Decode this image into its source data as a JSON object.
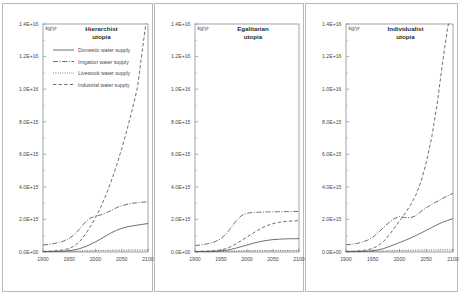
{
  "figure": {
    "unit_label": "kg/yr",
    "xlabel": "",
    "ylabel": "",
    "y_ticks": [
      "0.0E+00",
      "2.0E+15",
      "4.0E+15",
      "6.0E+15",
      "8.0E+15",
      "1.0E+16",
      "1.2E+16",
      "1.4E+16"
    ],
    "x_ticks": [
      "1900",
      "1950",
      "2000",
      "2050",
      "2100"
    ],
    "legend": [
      {
        "label": "Domestic water supply",
        "style": "solid",
        "key": "domestic"
      },
      {
        "label": "Irrigation water supply",
        "style": "dash-dot",
        "key": "irrigation"
      },
      {
        "label": "Livestock water supply",
        "style": "dotted",
        "key": "livestock"
      },
      {
        "label": "Industrial water supply",
        "style": "dashed",
        "key": "industrial"
      }
    ],
    "panels": [
      {
        "title_line1": "Hierarchist",
        "title_line2": "utopia"
      },
      {
        "title_line1": "Egalitarian",
        "title_line2": "utopia"
      },
      {
        "title_line1": "Individualist",
        "title_line2": "utopia"
      }
    ]
  },
  "chart_data": [
    {
      "type": "line",
      "title": "Hierarchist utopia",
      "xlabel": "",
      "ylabel": "kg/yr",
      "xlim": [
        1900,
        2100
      ],
      "ylim": [
        0,
        1.4e+16
      ],
      "grid": false,
      "legend_position": "top-left",
      "x": [
        1900,
        1910,
        1920,
        1930,
        1940,
        1950,
        1960,
        1970,
        1980,
        1990,
        2000,
        2010,
        2020,
        2030,
        2040,
        2050,
        2060,
        2070,
        2080,
        2090,
        2100
      ],
      "series": [
        {
          "name": "Domestic water supply",
          "style": "solid",
          "values": [
            20000000000000.0,
            25000000000000.0,
            30000000000000.0,
            40000000000000.0,
            55000000000000.0,
            80000000000000.0,
            130000000000000.0,
            210000000000000.0,
            320000000000000.0,
            460000000000000.0,
            620000000000000.0,
            800000000000000.0,
            1000000000000000.0,
            1180000000000000.0,
            1330000000000000.0,
            1450000000000000.0,
            1540000000000000.0,
            1600000000000000.0,
            1650000000000000.0,
            1700000000000000.0,
            1750000000000000.0
          ]
        },
        {
          "name": "Irrigation water supply",
          "style": "dash-dot",
          "values": [
            430000000000000.0,
            460000000000000.0,
            510000000000000.0,
            580000000000000.0,
            680000000000000.0,
            830000000000000.0,
            1080000000000000.0,
            1420000000000000.0,
            1820000000000000.0,
            2080000000000000.0,
            2200000000000000.0,
            2280000000000000.0,
            2400000000000000.0,
            2560000000000000.0,
            2720000000000000.0,
            2840000000000000.0,
            2930000000000000.0,
            2990000000000000.0,
            3030000000000000.0,
            3060000000000000.0,
            3080000000000000.0
          ]
        },
        {
          "name": "Livestock water supply",
          "style": "dotted",
          "values": [
            20000000000000.0,
            22000000000000.0,
            25000000000000.0,
            28000000000000.0,
            32000000000000.0,
            38000000000000.0,
            45000000000000.0,
            54000000000000.0,
            64000000000000.0,
            74000000000000.0,
            84000000000000.0,
            92000000000000.0,
            100000000000000.0,
            107000000000000.0,
            112000000000000.0,
            117000000000000.0,
            120000000000000.0,
            123000000000000.0,
            125000000000000.0,
            127000000000000.0,
            128000000000000.0
          ]
        },
        {
          "name": "Industrial water supply",
          "style": "dashed",
          "values": [
            30000000000000.0,
            40000000000000.0,
            60000000000000.0,
            90000000000000.0,
            140000000000000.0,
            220000000000000.0,
            380000000000000.0,
            650000000000000.0,
            1050000000000000.0,
            1550000000000000.0,
            2100000000000000.0,
            2750000000000000.0,
            3500000000000000.0,
            4350000000000000.0,
            5300000000000000.0,
            6350000000000000.0,
            7500000000000000.0,
            8750000000000000.0,
            1.01e+16,
            1.26e+16,
            1.5e+16
          ]
        }
      ]
    },
    {
      "type": "line",
      "title": "Egalitarian utopia",
      "xlabel": "",
      "ylabel": "kg/yr",
      "xlim": [
        1900,
        2100
      ],
      "ylim": [
        0,
        1.4e+16
      ],
      "grid": false,
      "legend_position": "none",
      "x": [
        1900,
        1910,
        1920,
        1930,
        1940,
        1950,
        1960,
        1970,
        1980,
        1990,
        2000,
        2010,
        2020,
        2030,
        2040,
        2050,
        2060,
        2070,
        2080,
        2090,
        2100
      ],
      "series": [
        {
          "name": "Domestic water supply",
          "style": "solid",
          "values": [
            20000000000000.0,
            24000000000000.0,
            29000000000000.0,
            37000000000000.0,
            50000000000000.0,
            72000000000000.0,
            110000000000000.0,
            170000000000000.0,
            250000000000000.0,
            340000000000000.0,
            430000000000000.0,
            520000000000000.0,
            600000000000000.0,
            670000000000000.0,
            720000000000000.0,
            760000000000000.0,
            785000000000000.0,
            800000000000000.0,
            810000000000000.0,
            815000000000000.0,
            820000000000000.0
          ]
        },
        {
          "name": "Irrigation water supply",
          "style": "dash-dot",
          "values": [
            400000000000000.0,
            430000000000000.0,
            480000000000000.0,
            550000000000000.0,
            650000000000000.0,
            820000000000000.0,
            1120000000000000.0,
            1520000000000000.0,
            1950000000000000.0,
            2250000000000000.0,
            2380000000000000.0,
            2420000000000000.0,
            2440000000000000.0,
            2450000000000000.0,
            2460000000000000.0,
            2470000000000000.0,
            2470000000000000.0,
            2480000000000000.0,
            2480000000000000.0,
            2490000000000000.0,
            2490000000000000.0
          ]
        },
        {
          "name": "Livestock water supply",
          "style": "dotted",
          "values": [
            20000000000000.0,
            22000000000000.0,
            24000000000000.0,
            27000000000000.0,
            31000000000000.0,
            36000000000000.0,
            43000000000000.0,
            51000000000000.0,
            60000000000000.0,
            68000000000000.0,
            75000000000000.0,
            80000000000000.0,
            84000000000000.0,
            87000000000000.0,
            89000000000000.0,
            90000000000000.0,
            91000000000000.0,
            92000000000000.0,
            92000000000000.0,
            93000000000000.0,
            93000000000000.0
          ]
        },
        {
          "name": "Industrial water supply",
          "style": "dashed",
          "values": [
            30000000000000.0,
            36000000000000.0,
            46000000000000.0,
            62000000000000.0,
            88000000000000.0,
            130000000000000.0,
            210000000000000.0,
            340000000000000.0,
            520000000000000.0,
            720000000000000.0,
            920000000000000.0,
            1120000000000000.0,
            1320000000000000.0,
            1500000000000000.0,
            1640000000000000.0,
            1740000000000000.0,
            1810000000000000.0,
            1860000000000000.0,
            1890000000000000.0,
            1910000000000000.0,
            1930000000000000.0
          ]
        }
      ]
    },
    {
      "type": "line",
      "title": "Individualist utopia",
      "xlabel": "",
      "ylabel": "kg/yr",
      "xlim": [
        1900,
        2100
      ],
      "ylim": [
        0,
        1.4e+16
      ],
      "grid": false,
      "legend_position": "none",
      "x": [
        1900,
        1910,
        1920,
        1930,
        1940,
        1950,
        1960,
        1970,
        1980,
        1990,
        2000,
        2010,
        2020,
        2030,
        2040,
        2050,
        2060,
        2070,
        2080,
        2090,
        2100
      ],
      "series": [
        {
          "name": "Domestic water supply",
          "style": "solid",
          "values": [
            20000000000000.0,
            25000000000000.0,
            30000000000000.0,
            40000000000000.0,
            55000000000000.0,
            80000000000000.0,
            130000000000000.0,
            210000000000000.0,
            320000000000000.0,
            450000000000000.0,
            580000000000000.0,
            710000000000000.0,
            850000000000000.0,
            1000000000000000.0,
            1160000000000000.0,
            1330000000000000.0,
            1500000000000000.0,
            1670000000000000.0,
            1820000000000000.0,
            1940000000000000.0,
            2050000000000000.0
          ]
        },
        {
          "name": "Irrigation water supply",
          "style": "dash-dot",
          "values": [
            440000000000000.0,
            470000000000000.0,
            520000000000000.0,
            600000000000000.0,
            720000000000000.0,
            900000000000000.0,
            1180000000000000.0,
            1500000000000000.0,
            1800000000000000.0,
            2050000000000000.0,
            2180000000000000.0,
            2120000000000000.0,
            2100000000000000.0,
            2220000000000000.0,
            2480000000000000.0,
            2720000000000000.0,
            2920000000000000.0,
            3100000000000000.0,
            3280000000000000.0,
            3450000000000000.0,
            3600000000000000.0
          ]
        },
        {
          "name": "Livestock water supply",
          "style": "dotted",
          "values": [
            20000000000000.0,
            22000000000000.0,
            25000000000000.0,
            29000000000000.0,
            34000000000000.0,
            40000000000000.0,
            49000000000000.0,
            60000000000000.0,
            72000000000000.0,
            84000000000000.0,
            95000000000000.0,
            104000000000000.0,
            112000000000000.0,
            119000000000000.0,
            125000000000000.0,
            130000000000000.0,
            134000000000000.0,
            137000000000000.0,
            139000000000000.0,
            141000000000000.0,
            142000000000000.0
          ]
        },
        {
          "name": "Industrial water supply",
          "style": "dashed",
          "values": [
            30000000000000.0,
            40000000000000.0,
            58000000000000.0,
            88000000000000.0,
            140000000000000.0,
            225000000000000.0,
            380000000000000.0,
            640000000000000.0,
            1020000000000000.0,
            1450000000000000.0,
            1900000000000000.0,
            2350000000000000.0,
            2850000000000000.0,
            3450000000000000.0,
            4300000000000000.0,
            5500000000000000.0,
            7000000000000000.0,
            9000000000000000.0,
            1.15e+16,
            1.38e+16,
            1.5e+16
          ]
        }
      ]
    }
  ]
}
